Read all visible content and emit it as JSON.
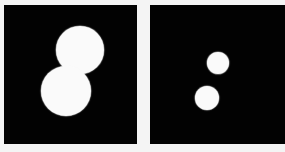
{
  "background_color": "#f4f4f4",
  "panels": [
    {
      "name": "left-panel",
      "x": 4,
      "y": 5,
      "width": 133,
      "height": 139,
      "color": "#020202",
      "blobs": [
        {
          "cx": 80,
          "cy": 50,
          "r": 24
        },
        {
          "cx": 66,
          "cy": 91,
          "r": 25
        }
      ]
    },
    {
      "name": "right-panel",
      "x": 150,
      "y": 5,
      "width": 135,
      "height": 139,
      "color": "#020202",
      "blobs": [
        {
          "cx": 218,
          "cy": 63,
          "r": 11
        },
        {
          "cx": 207,
          "cy": 98,
          "r": 12
        }
      ]
    }
  ]
}
